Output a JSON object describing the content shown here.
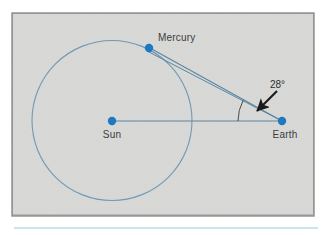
{
  "figure": {
    "background_color": "#ffffff",
    "panel": {
      "fill": "#d9d9d7",
      "border_color": "#8d8d8d",
      "x": 12,
      "y": 13,
      "width": 302,
      "height": 203
    },
    "rule": {
      "color": "#b9dcec",
      "x1": 14,
      "x2": 318,
      "y": 228
    }
  },
  "colors": {
    "body_dot": "#1f79c0",
    "orbit": "#6f9ab5",
    "sight_line": "#5a86a3",
    "label_text": "#3d3d3d",
    "angle_text": "#2e2e2e",
    "arrow": "#1a1a1a",
    "panel_fill": "#d9d9d7",
    "panel_border": "#8d8d8d",
    "accent_rule": "#b9dcec"
  },
  "bodies": [
    {
      "name": "Sun",
      "label": "Sun",
      "cx": 112,
      "cy": 121,
      "r": 4.2,
      "label_x": 112,
      "label_y": 138,
      "label_anchor": "middle"
    },
    {
      "name": "Mercury",
      "label": "Mercury",
      "cx": 149,
      "cy": 48,
      "r": 4.2,
      "label_x": 158,
      "label_y": 41,
      "label_anchor": "start"
    },
    {
      "name": "Earth",
      "label": "Earth",
      "cx": 282,
      "cy": 121,
      "r": 4.2,
      "label_x": 285,
      "label_y": 138,
      "label_anchor": "middle"
    }
  ],
  "orbit": {
    "name": "mercury-orbit",
    "cx": 112,
    "cy": 120.5,
    "r": 80
  },
  "lines": [
    {
      "name": "sun-earth-line",
      "x1": 112,
      "y1": 121,
      "x2": 282,
      "y2": 121
    },
    {
      "name": "earth-mercury-sight-line",
      "x1": 282,
      "y1": 121,
      "x2": 149,
      "y2": 48
    },
    {
      "name": "earth-tangent-line",
      "x1": 282,
      "y1": 121,
      "x2": 149,
      "y2": 50
    }
  ],
  "angle": {
    "name": "elongation-angle",
    "value": "28°",
    "label_x": 272,
    "label_y": 88,
    "vertex_x": 282,
    "vertex_y": 121,
    "arc_radius": 44,
    "arc_start_deg": 0,
    "arc_end_deg": 28
  },
  "arrow": {
    "name": "angle-pointer-arrow",
    "x1": 276,
    "y1": 92,
    "x2": 256,
    "y2": 112
  }
}
